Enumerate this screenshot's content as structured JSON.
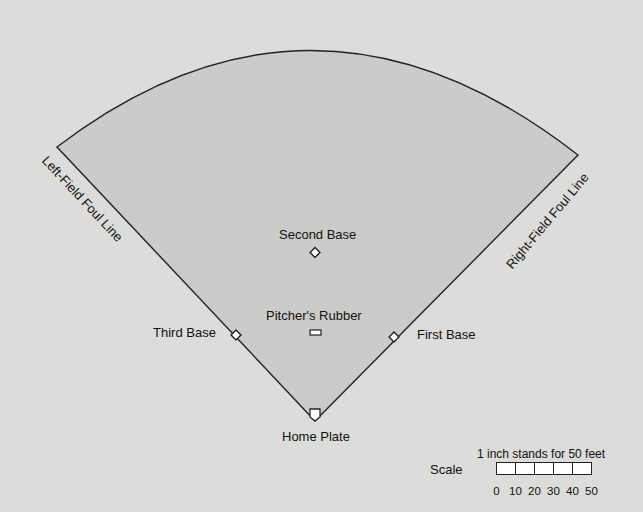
{
  "diagram": {
    "colors": {
      "background": "#dcdcda",
      "field_fill": "#cbcbc9",
      "outline": "#222222",
      "base_fill": "#ffffff"
    },
    "labels": {
      "left_foul_line": "Left-Field Foul Line",
      "right_foul_line": "Right-Field Foul Line",
      "second_base": "Second Base",
      "pitchers_rubber": "Pitcher's Rubber",
      "third_base": "Third Base",
      "first_base": "First Base",
      "home_plate": "Home Plate"
    },
    "scale": {
      "label": "Scale",
      "caption": "1 inch stands for 50 feet",
      "ticks": [
        "0",
        "10",
        "20",
        "30",
        "40",
        "50"
      ],
      "segments": 5
    }
  }
}
